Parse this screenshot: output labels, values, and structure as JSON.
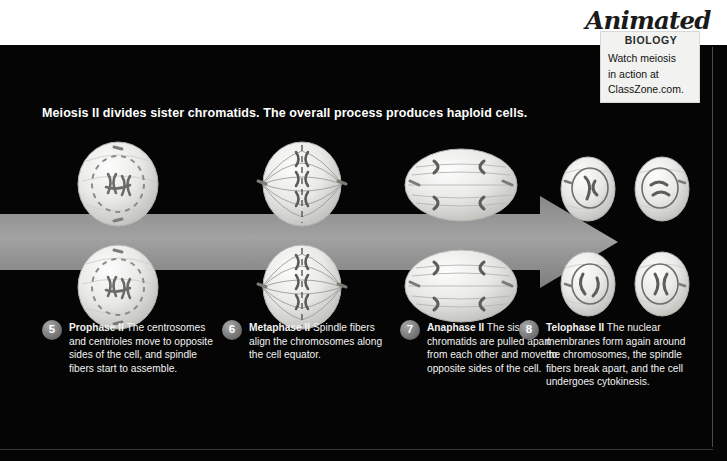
{
  "page": {
    "background_color": "#ffffff",
    "panel_color": "#050505",
    "arrow_color": "#9a9a9a"
  },
  "heading": {
    "text": "Meiosis II divides sister chromatids. The overall process produces haploid cells."
  },
  "badge": {
    "logo": "Animated",
    "subtitle": "BIOLOGY",
    "lines": [
      "Watch meiosis",
      "in action at",
      "ClassZone.com."
    ]
  },
  "arrow": {
    "name": "process-direction-arrow",
    "color": "#9a9a9a"
  },
  "stages": [
    {
      "number": "5",
      "term": "Prophase II",
      "text": "The centrosomes and centrioles move to opposite sides of the cell, and spindle fibers start to assemble.",
      "cell_label": "prophase-II-cell"
    },
    {
      "number": "6",
      "term": "Metaphase II",
      "text": "Spindle fibers align the chromosomes along the cell equator.",
      "cell_label": "metaphase-II-cell"
    },
    {
      "number": "7",
      "term": "Anaphase II",
      "text": "The sister chromatids are pulled apart from each other and move to opposite sides of the cell.",
      "cell_label": "anaphase-II-cell"
    },
    {
      "number": "8",
      "term": "Telophase II",
      "text": "The nuclear membranes form again around the chromosomes, the spindle fibers break apart, and the cell undergoes cytokinesis.",
      "cell_label": "telophase-II-cell"
    }
  ]
}
